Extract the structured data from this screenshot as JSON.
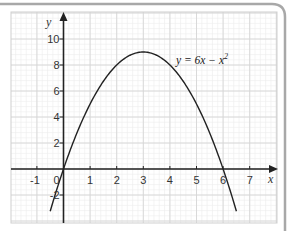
{
  "chart_data": {
    "type": "line",
    "title": "",
    "xlabel": "x",
    "ylabel": "y",
    "xlim": [
      -2,
      7.5
    ],
    "ylim": [
      -3.5,
      12
    ],
    "grid": true,
    "x_ticks": [
      "-1",
      "0",
      "1",
      "2",
      "3",
      "4",
      "5",
      "6",
      "7"
    ],
    "y_ticks": [
      "-2",
      "2",
      "4",
      "6",
      "8",
      "10"
    ],
    "series": [
      {
        "name": "y = 6x − x²",
        "equation": "y = 6x - x^2",
        "x": [
          -0.5,
          0,
          0.5,
          1,
          1.5,
          2,
          2.5,
          3,
          3.5,
          4,
          4.5,
          5,
          5.5,
          6,
          6.5
        ],
        "values": [
          -3.25,
          0,
          2.75,
          5,
          6.75,
          8,
          8.75,
          9,
          8.75,
          8,
          6.75,
          5,
          2.75,
          0,
          -3.25
        ]
      }
    ],
    "annotations": [
      {
        "text": "y = 6x − x²",
        "x": 4.3,
        "y": 8.3
      }
    ]
  },
  "labels": {
    "x_axis": "x",
    "y_axis": "y",
    "equation_main": "y = 6x − x",
    "equation_exp": "2",
    "x_ticks": [
      {
        "label": "-1",
        "v": -1
      },
      {
        "label": "0",
        "v": 0
      },
      {
        "label": "1",
        "v": 1
      },
      {
        "label": "2",
        "v": 2
      },
      {
        "label": "3",
        "v": 3
      },
      {
        "label": "4",
        "v": 4
      },
      {
        "label": "5",
        "v": 5
      },
      {
        "label": "6",
        "v": 6
      },
      {
        "label": "7",
        "v": 7
      }
    ],
    "y_ticks": [
      {
        "label": "-2",
        "v": -2
      },
      {
        "label": "2",
        "v": 2
      },
      {
        "label": "4",
        "v": 4
      },
      {
        "label": "6",
        "v": 6
      },
      {
        "label": "8",
        "v": 8
      },
      {
        "label": "10",
        "v": 10
      }
    ]
  },
  "colors": {
    "axis": "#222222",
    "curve": "#222222",
    "grid_major": "#d6d6d6",
    "grid_minor": "#ededed",
    "frame": "#9a9a9a"
  }
}
